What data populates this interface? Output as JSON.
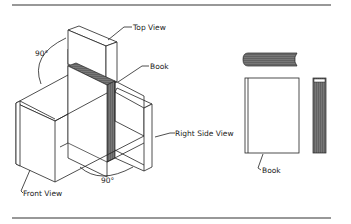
{
  "diagram": {
    "labels": {
      "top_view": "Top View",
      "book_top": "Book",
      "right_side_view": "Right Side View",
      "front_view": "Front View",
      "book_bottom": "Book",
      "angle_top": "90°",
      "angle_bottom": "90°"
    },
    "colors": {
      "line": "#222222",
      "book_fill": "#6e6e6e",
      "background": "#ffffff"
    }
  }
}
